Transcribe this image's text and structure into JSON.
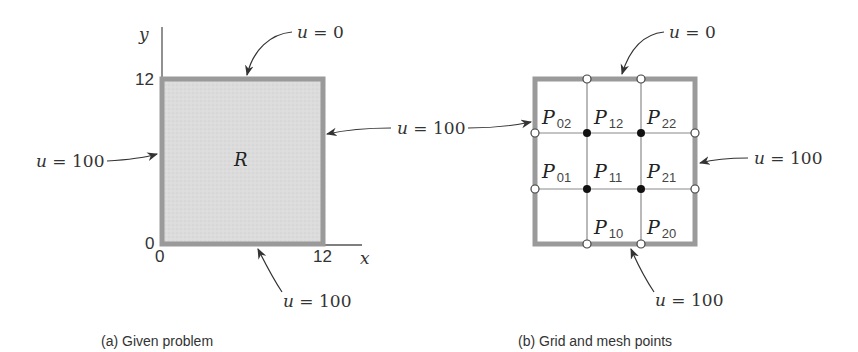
{
  "panel_a": {
    "caption": "(a)  Given problem",
    "region_label": "R",
    "axis_x": "x",
    "axis_y": "y",
    "tick_x_0": "0",
    "tick_x_12": "12",
    "tick_y_0": "0",
    "tick_y_12": "12",
    "bc_top": "u = 0",
    "bc_left": "u = 100",
    "bc_bottom": "u = 100",
    "bc_right_shared": "u = 100",
    "fill_color": "#d9d9d9",
    "border_color": "#9a9a9a"
  },
  "panel_b": {
    "caption": "(b)  Grid and mesh points",
    "bc_top": "u = 0",
    "bc_right": "u = 100",
    "bc_bottom": "u = 100",
    "points": [
      {
        "id": "P02",
        "main": "P",
        "sub": "02"
      },
      {
        "id": "P12",
        "main": "P",
        "sub": "12"
      },
      {
        "id": "P22",
        "main": "P",
        "sub": "22"
      },
      {
        "id": "P01",
        "main": "P",
        "sub": "01"
      },
      {
        "id": "P11",
        "main": "P",
        "sub": "11"
      },
      {
        "id": "P21",
        "main": "P",
        "sub": "21"
      },
      {
        "id": "P10",
        "main": "P",
        "sub": "10"
      },
      {
        "id": "P20",
        "main": "P",
        "sub": "20"
      }
    ],
    "border_color": "#9a9a9a",
    "grid_color": "#8a8a8a"
  }
}
